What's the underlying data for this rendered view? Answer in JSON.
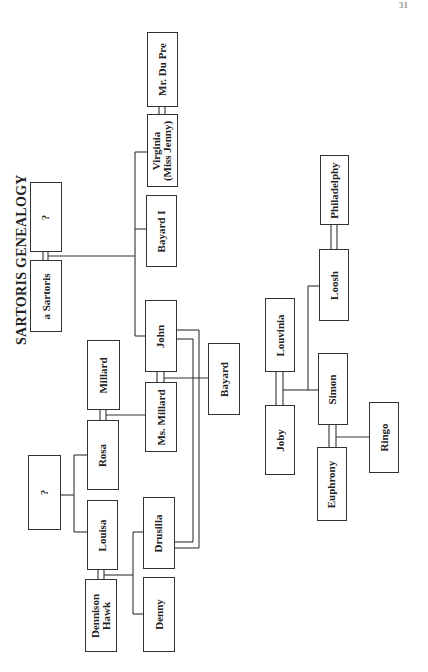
{
  "page_number": "31",
  "title": "SARTORIS GENEALOGY",
  "colors": {
    "line": "#333333",
    "text": "#222222",
    "background": "#ffffff"
  },
  "nodes": {
    "unknown_1": "?",
    "a_sartoris": "a Sartoris",
    "mr_du_pre": "Mr. Du Pre",
    "virginia": "Virginia\n(Miss Jenny)",
    "virginia_line1": "Virginia",
    "virginia_line2": "(Miss Jenny)",
    "bayard_i": "Bayard I",
    "john": "John",
    "bayard": "Bayard",
    "millard": "Millard",
    "ms_millard": "Ms. Millard",
    "rosa": "Rosa",
    "unknown_2": "?",
    "louisa": "Louisa",
    "drusilla": "Drusilla",
    "dennison_hawk_line1": "Dennison",
    "dennison_hawk_line2": "Hawk",
    "denny": "Denny",
    "philadelphy": "Philadelphy",
    "loosh": "Loosh",
    "louvinia": "Louvinia",
    "joby": "Joby",
    "simon": "Simon",
    "euphrony": "Euphrony",
    "ringo": "Ringo"
  },
  "relationships": {
    "marriages": [
      [
        "?",
        "a Sartoris"
      ],
      [
        "Virginia (Miss Jenny)",
        "Mr. Du Pre"
      ],
      [
        "Millard",
        "Rosa"
      ],
      [
        "John",
        "Ms. Millard"
      ],
      [
        "Louisa",
        "Dennison Hawk"
      ],
      [
        "Philadelphy",
        "Loosh"
      ],
      [
        "Louvinia",
        "Joby"
      ],
      [
        "Simon",
        "Euphrony"
      ]
    ],
    "children": [
      {
        "parents": [
          "?",
          "a Sartoris"
        ],
        "children": [
          "Virginia (Miss Jenny)",
          "Bayard I",
          "John"
        ]
      },
      {
        "parents": [
          "John",
          "Ms. Millard"
        ],
        "children": [
          "Bayard"
        ]
      },
      {
        "parents": [
          "Millard",
          "Rosa"
        ],
        "children": [
          "Ms. Millard"
        ]
      },
      {
        "parents": [
          "?"
        ],
        "children": [
          "Rosa",
          "Louisa"
        ]
      },
      {
        "parents": [
          "Louisa",
          "Dennison Hawk"
        ],
        "children": [
          "Drusilla",
          "Denny"
        ]
      },
      {
        "parents": [
          "Louvinia",
          "Joby"
        ],
        "children": [
          "Loosh",
          "Simon"
        ]
      },
      {
        "parents": [
          "Simon",
          "Euphrony"
        ],
        "children": [
          "Ringo"
        ]
      }
    ],
    "other_links": [
      [
        "John",
        "Drusilla"
      ]
    ]
  }
}
